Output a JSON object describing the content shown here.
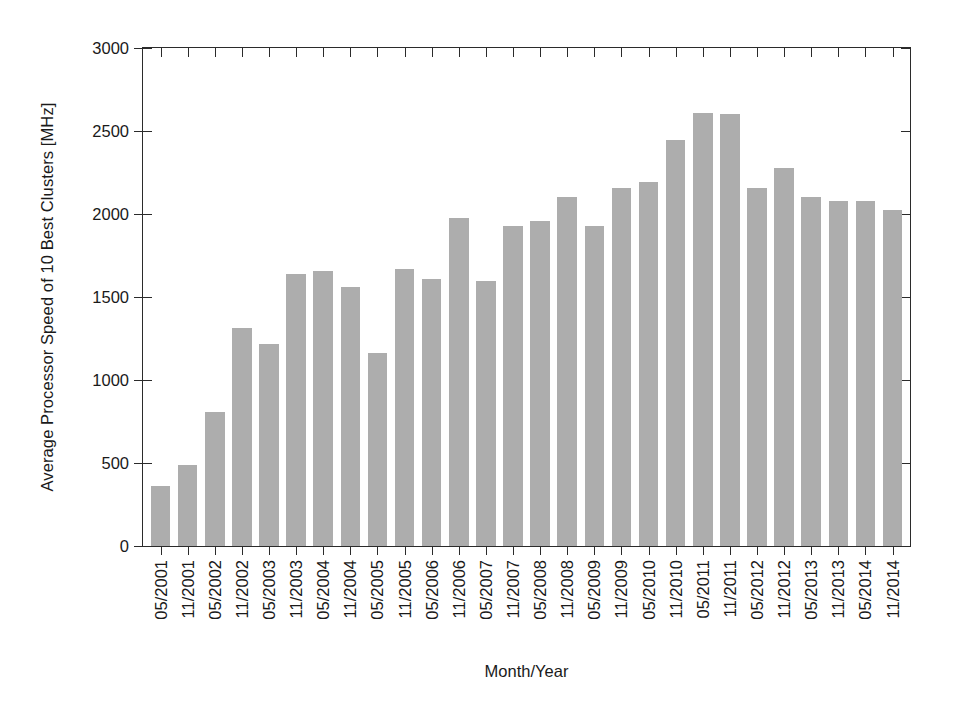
{
  "chart_data": {
    "type": "bar",
    "title": "",
    "xlabel": "Month/Year",
    "ylabel": "Average Processor Speed of 10 Best Clusters [MHz]",
    "ylim": [
      0,
      3000
    ],
    "yticks": [
      0,
      500,
      1000,
      1500,
      2000,
      2500,
      3000
    ],
    "ytick_labels": [
      "0",
      "500",
      "1000",
      "1500",
      "2000",
      "2500",
      "3000"
    ],
    "grid": false,
    "legend": null,
    "bar_color": "#adadad",
    "axis_color": "#2b2b2b",
    "categories": [
      "05/2001",
      "11/2001",
      "05/2002",
      "11/2002",
      "05/2003",
      "11/2003",
      "05/2004",
      "11/2004",
      "05/2005",
      "11/2005",
      "05/2006",
      "11/2006",
      "05/2007",
      "11/2007",
      "05/2008",
      "11/2008",
      "05/2009",
      "11/2009",
      "05/2010",
      "11/2010",
      "05/2011",
      "11/2011",
      "05/2012",
      "11/2012",
      "05/2013",
      "11/2013",
      "05/2014",
      "11/2014"
    ],
    "values": [
      360,
      490,
      810,
      1315,
      1215,
      1640,
      1655,
      1560,
      1165,
      1670,
      1610,
      1975,
      1595,
      1925,
      1955,
      2105,
      1930,
      2155,
      2190,
      2445,
      2610,
      2605,
      2155,
      2275,
      2100,
      2080,
      2080,
      2025
    ]
  }
}
